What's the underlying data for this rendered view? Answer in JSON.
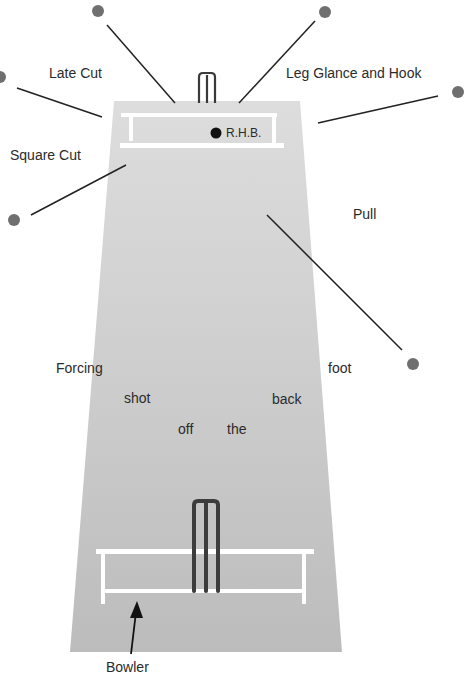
{
  "diagram": {
    "colors": {
      "pitch_top": "#dcdcdc",
      "pitch_bottom": "#bdbdbd",
      "crease": "#ffffff",
      "stumps": "#3e3e3e",
      "fielder_dot": "#6e6e6e",
      "line": "#222222",
      "batsman_dot": "#111111"
    },
    "batsman_label": "R.H.B.",
    "bowler_label": "Bowler",
    "shots": [
      {
        "label": "Late Cut"
      },
      {
        "label": "Leg Glance and Hook"
      },
      {
        "label": "Square Cut"
      },
      {
        "label": "Pull"
      }
    ],
    "forcing_shot_words": [
      "Forcing",
      "shot",
      "off",
      "the",
      "back",
      "foot"
    ]
  }
}
